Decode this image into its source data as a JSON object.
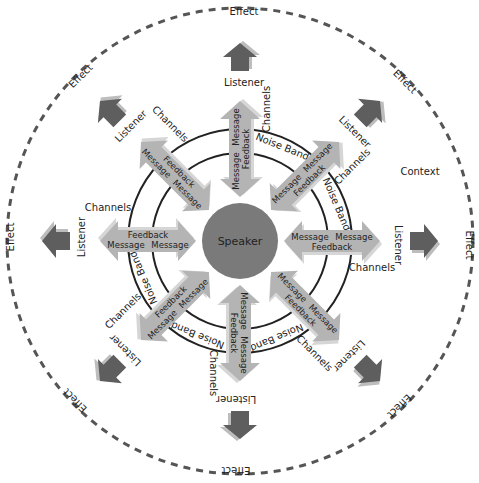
{
  "diagram": {
    "title": "",
    "center": {
      "label": "Speaker",
      "color": "#7a7a7a"
    },
    "rings": {
      "inner_label": "Noise Band",
      "stroke": "#222222"
    },
    "outer_boundary": {
      "label": "Context",
      "style": "dashed",
      "color": "#555555"
    },
    "colors": {
      "double_arrow": "#b4b4b4",
      "double_arrow_shadow": "#d6d6d6",
      "effect_arrow": "#5e5e5e",
      "effect_arrow_shadow": "#bdbdbd"
    },
    "spokes": [
      {
        "angle_deg": -90,
        "message_out": "Message",
        "message_in": "Message",
        "feedback": "Feedback",
        "listener": "Listener",
        "effect": "Effect",
        "channels": "Channels",
        "noise_band": "Noise Band"
      },
      {
        "angle_deg": -45,
        "message_out": "Message",
        "message_in": "Message",
        "feedback": "Feedback",
        "listener": "Listener",
        "effect": "Effect",
        "channels": "Channels",
        "noise_band": "Noise Band"
      },
      {
        "angle_deg": 0,
        "message_out": "Message",
        "message_in": "Message",
        "feedback": "Feedback",
        "listener": "Listener",
        "effect": "Effect",
        "channels": "Channels",
        "noise_band": ""
      },
      {
        "angle_deg": 45,
        "message_out": "Message",
        "message_in": "Message",
        "feedback": "Feedback",
        "listener": "Listener",
        "effect": "Effect",
        "channels": "Channels",
        "noise_band": "Noise Band"
      },
      {
        "angle_deg": 90,
        "message_out": "Message",
        "message_in": "Message",
        "feedback": "Feedback",
        "listener": "Listener",
        "effect": "Effect",
        "channels": "Channels",
        "noise_band": "Noise Band"
      },
      {
        "angle_deg": 135,
        "message_out": "Message",
        "message_in": "Message",
        "feedback": "Feedback",
        "listener": "Listener",
        "effect": "Effect",
        "channels": "Channels",
        "noise_band": "Noise Band"
      },
      {
        "angle_deg": 180,
        "message_out": "Message",
        "message_in": "Message",
        "feedback": "Feedback",
        "listener": "Listener",
        "effect": "Effect",
        "channels": "Channels",
        "noise_band": ""
      },
      {
        "angle_deg": -135,
        "message_out": "Message",
        "message_in": "Message",
        "feedback": "Feedback",
        "listener": "Listener",
        "effect": "Effect",
        "channels": "Channels",
        "noise_band": ""
      }
    ]
  }
}
